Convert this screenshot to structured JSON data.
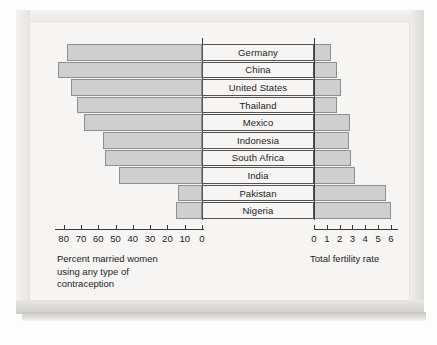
{
  "chart_data": {
    "type": "bar",
    "title": "",
    "subtitle": "",
    "orientation": "horizontal-bidirectional",
    "categories": [
      "Germany",
      "China",
      "United States",
      "Thailand",
      "Mexico",
      "Indonesia",
      "South Africa",
      "India",
      "Pakistan",
      "Nigeria"
    ],
    "left_panel": {
      "xlabel": "Percent married women using any type of contraception",
      "xlabel_lines": [
        "Percent married women",
        "using any type of",
        "contraception"
      ],
      "ticks": [
        80,
        70,
        60,
        50,
        40,
        30,
        20,
        10,
        0
      ],
      "tick_labels": [
        "80",
        "70",
        "60",
        "50",
        "40",
        "30",
        "20",
        "10",
        "0"
      ],
      "xlim": [
        0,
        85
      ],
      "direction": "right-to-left",
      "values": [
        78,
        83,
        76,
        72,
        68,
        57,
        56,
        48,
        14,
        15
      ],
      "grid": false
    },
    "right_panel": {
      "xlabel": "Total fertility rate",
      "ticks": [
        0,
        1,
        2,
        3,
        4,
        5,
        6
      ],
      "tick_labels": [
        "0",
        "1",
        "2",
        "3",
        "4",
        "5",
        "6"
      ],
      "xlim": [
        0,
        6.4
      ],
      "direction": "left-to-right",
      "values": [
        1.3,
        1.8,
        2.1,
        1.8,
        2.8,
        2.7,
        2.9,
        3.2,
        5.6,
        6.0
      ],
      "grid": false
    },
    "series": [
      {
        "name": "Percent married women using any type of contraception",
        "values": [
          78,
          83,
          76,
          72,
          68,
          57,
          56,
          48,
          14,
          15
        ]
      },
      {
        "name": "Total fertility rate",
        "values": [
          1.3,
          1.8,
          2.1,
          1.8,
          2.8,
          2.7,
          2.9,
          3.2,
          5.6,
          6.0
        ]
      }
    ],
    "legend": [],
    "colors": {
      "bar_fill": "#cfcfcf",
      "bar_stroke": "#8e8e8e",
      "axis": "#3a3a3a",
      "text": "#1c1c1c",
      "plate_background": "#f6f5f3"
    }
  }
}
